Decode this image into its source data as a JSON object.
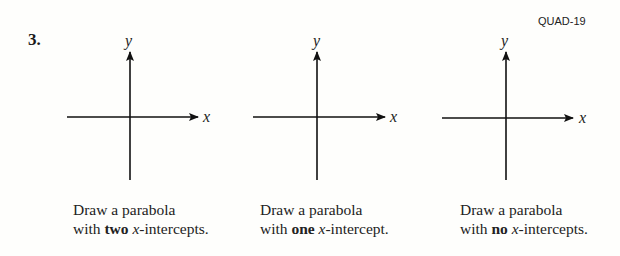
{
  "header": {
    "code": "QUAD-19",
    "problem_number": "3."
  },
  "axes_labels": {
    "x": "x",
    "y": "y"
  },
  "panels": [
    {
      "line1": "Draw a parabola",
      "pre": "with ",
      "bold": "two",
      "var": "x",
      "post": "-intercepts."
    },
    {
      "line1": "Draw a parabola",
      "pre": "with ",
      "bold": "one",
      "var": "x",
      "post": "-intercept."
    },
    {
      "line1": "Draw a parabola",
      "pre": "with ",
      "bold": "no",
      "var": "x",
      "post": "-intercepts."
    }
  ]
}
